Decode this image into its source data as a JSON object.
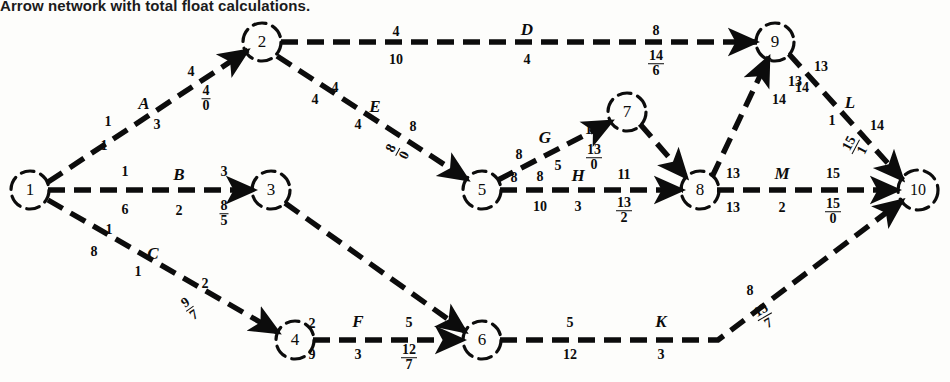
{
  "caption": "Arrow network with total float calculations.",
  "diagram": {
    "title": "Arrow network with total float calculations.",
    "type": "activity-on-arrow-network",
    "nodes": [
      {
        "id": "1",
        "label": "1",
        "x": 30,
        "y": 190
      },
      {
        "id": "2",
        "label": "2",
        "x": 262,
        "y": 42
      },
      {
        "id": "3",
        "label": "3",
        "x": 271,
        "y": 190
      },
      {
        "id": "4",
        "label": "4",
        "x": 295,
        "y": 340
      },
      {
        "id": "5",
        "label": "5",
        "x": 482,
        "y": 190
      },
      {
        "id": "6",
        "label": "6",
        "x": 482,
        "y": 340
      },
      {
        "id": "7",
        "label": "7",
        "x": 627,
        "y": 112
      },
      {
        "id": "8",
        "label": "8",
        "x": 700,
        "y": 190
      },
      {
        "id": "9",
        "label": "9",
        "x": 775,
        "y": 42
      },
      {
        "id": "10",
        "label": "10",
        "x": 918,
        "y": 190
      }
    ],
    "edges": [
      {
        "id": "A",
        "from": "1",
        "to": "2",
        "activity": "A",
        "dashed": true
      },
      {
        "id": "B",
        "from": "1",
        "to": "3",
        "activity": "B",
        "dashed": true
      },
      {
        "id": "C",
        "from": "1",
        "to": "4",
        "activity": "C",
        "dashed": true
      },
      {
        "id": "D",
        "from": "2",
        "to": "9",
        "activity": "D",
        "dashed": true
      },
      {
        "id": "E",
        "from": "2",
        "to": "5",
        "activity": "E",
        "dashed": true
      },
      {
        "id": "G",
        "from": "5",
        "to": "7",
        "activity": "G",
        "dashed": true
      },
      {
        "id": "H",
        "from": "5",
        "to": "8",
        "activity": "H",
        "dashed": true
      },
      {
        "id": "F",
        "from": "4",
        "to": "6",
        "activity": "F",
        "dashed": true
      },
      {
        "id": "K",
        "from": "6",
        "to": "10",
        "activity": "K",
        "dashed": true
      },
      {
        "id": "L",
        "from": "9",
        "to": "10",
        "activity": "L",
        "dashed": true
      },
      {
        "id": "M",
        "from": "8",
        "to": "10",
        "activity": "M",
        "dashed": true
      },
      {
        "id": "d1",
        "from": "3",
        "to": "6",
        "activity": "",
        "dashed": true
      },
      {
        "id": "d2",
        "from": "7",
        "to": "8",
        "activity": "",
        "dashed": true
      },
      {
        "id": "d3",
        "from": "8",
        "to": "9",
        "activity": "",
        "dashed": true
      }
    ],
    "labels": [
      {
        "id": "A-es",
        "edge": "A",
        "kind": "number",
        "text": "1",
        "x": 108,
        "y": 122
      },
      {
        "id": "A-ls",
        "edge": "A",
        "kind": "number",
        "text": "1",
        "x": 104,
        "y": 146
      },
      {
        "id": "A-name",
        "edge": "A",
        "kind": "activity",
        "text": "A",
        "x": 144,
        "y": 103
      },
      {
        "id": "A-dur",
        "edge": "A",
        "kind": "number",
        "text": "3",
        "x": 157,
        "y": 125
      },
      {
        "id": "A-ef",
        "edge": "A",
        "kind": "number",
        "text": "4",
        "x": 191,
        "y": 72
      },
      {
        "id": "A-frac",
        "edge": "A",
        "kind": "fraction",
        "top": "4",
        "bottom": "0",
        "x": 206,
        "y": 99
      },
      {
        "id": "B-es",
        "edge": "B",
        "kind": "number",
        "text": "1",
        "x": 125,
        "y": 172
      },
      {
        "id": "B-ls",
        "edge": "B",
        "kind": "number",
        "text": "6",
        "x": 125,
        "y": 210
      },
      {
        "id": "B-name",
        "edge": "B",
        "kind": "activity",
        "text": "B",
        "x": 179,
        "y": 174
      },
      {
        "id": "B-dur",
        "edge": "B",
        "kind": "number",
        "text": "2",
        "x": 179,
        "y": 211
      },
      {
        "id": "B-ef",
        "edge": "B",
        "kind": "number",
        "text": "3",
        "x": 224,
        "y": 172
      },
      {
        "id": "B-frac",
        "edge": "B",
        "kind": "fraction",
        "top": "8",
        "bottom": "5",
        "x": 224,
        "y": 214
      },
      {
        "id": "C-es",
        "edge": "C",
        "kind": "number",
        "text": "1",
        "x": 109,
        "y": 230
      },
      {
        "id": "C-ls",
        "edge": "C",
        "kind": "number",
        "text": "8",
        "x": 94,
        "y": 252
      },
      {
        "id": "C-name",
        "edge": "C",
        "kind": "activity",
        "text": "C",
        "x": 153,
        "y": 253
      },
      {
        "id": "C-dur",
        "edge": "C",
        "kind": "number",
        "text": "1",
        "x": 138,
        "y": 272
      },
      {
        "id": "C-ef",
        "edge": "C",
        "kind": "number",
        "text": "2",
        "x": 205,
        "y": 284
      },
      {
        "id": "C-frac",
        "edge": "C",
        "kind": "fraction",
        "top": "9",
        "bottom": "7",
        "x": 190,
        "y": 309,
        "rotate": -35
      },
      {
        "id": "D-es",
        "edge": "D",
        "kind": "number",
        "text": "4",
        "x": 396,
        "y": 32
      },
      {
        "id": "D-ls",
        "edge": "D",
        "kind": "number",
        "text": "10",
        "x": 396,
        "y": 60
      },
      {
        "id": "D-name",
        "edge": "D",
        "kind": "activity",
        "text": "D",
        "x": 527,
        "y": 29
      },
      {
        "id": "D-dur",
        "edge": "D",
        "kind": "number",
        "text": "4",
        "x": 527,
        "y": 60
      },
      {
        "id": "D-ef",
        "edge": "D",
        "kind": "number",
        "text": "8",
        "x": 656,
        "y": 31
      },
      {
        "id": "D-frac",
        "edge": "D",
        "kind": "fraction",
        "top": "14",
        "bottom": "6",
        "x": 656,
        "y": 64
      },
      {
        "id": "E-es",
        "edge": "E",
        "kind": "number",
        "text": "4",
        "x": 335,
        "y": 88
      },
      {
        "id": "E-ls",
        "edge": "E",
        "kind": "number",
        "text": "4",
        "x": 315,
        "y": 100
      },
      {
        "id": "E-name",
        "edge": "E",
        "kind": "activity",
        "text": "E",
        "x": 375,
        "y": 106
      },
      {
        "id": "E-dur",
        "edge": "E",
        "kind": "number",
        "text": "4",
        "x": 358,
        "y": 125
      },
      {
        "id": "E-ef",
        "edge": "E",
        "kind": "number",
        "text": "8",
        "x": 413,
        "y": 127
      },
      {
        "id": "E-frac",
        "edge": "E",
        "kind": "fraction",
        "top": "8",
        "bottom": "0",
        "x": 398,
        "y": 152,
        "rotate": -62
      },
      {
        "id": "G-es",
        "edge": "G",
        "kind": "number",
        "text": "8",
        "x": 519,
        "y": 155
      },
      {
        "id": "G-ls",
        "edge": "G",
        "kind": "number",
        "text": "8",
        "x": 514,
        "y": 178
      },
      {
        "id": "G-name",
        "edge": "G",
        "kind": "activity",
        "text": "G",
        "x": 545,
        "y": 137
      },
      {
        "id": "G-dur",
        "edge": "G",
        "kind": "number",
        "text": "5",
        "x": 558,
        "y": 166
      },
      {
        "id": "G-ef",
        "edge": "G",
        "kind": "number",
        "text": "13",
        "x": 592,
        "y": 130
      },
      {
        "id": "G-frac",
        "edge": "G",
        "kind": "fraction",
        "top": "13",
        "bottom": "0",
        "x": 594,
        "y": 158
      },
      {
        "id": "H-es",
        "edge": "H",
        "kind": "number",
        "text": "8",
        "x": 540,
        "y": 177
      },
      {
        "id": "H-ls",
        "edge": "H",
        "kind": "number",
        "text": "10",
        "x": 540,
        "y": 207
      },
      {
        "id": "H-name",
        "edge": "H",
        "kind": "activity",
        "text": "H",
        "x": 578,
        "y": 175
      },
      {
        "id": "H-dur",
        "edge": "H",
        "kind": "number",
        "text": "3",
        "x": 578,
        "y": 207
      },
      {
        "id": "H-ef",
        "edge": "H",
        "kind": "number",
        "text": "11",
        "x": 624,
        "y": 175
      },
      {
        "id": "H-frac",
        "edge": "H",
        "kind": "fraction",
        "top": "13",
        "bottom": "2",
        "x": 624,
        "y": 211
      },
      {
        "id": "F-es",
        "edge": "F",
        "kind": "number",
        "text": "2",
        "x": 312,
        "y": 324
      },
      {
        "id": "F-ls",
        "edge": "F",
        "kind": "number",
        "text": "9",
        "x": 312,
        "y": 355
      },
      {
        "id": "F-name",
        "edge": "F",
        "kind": "activity",
        "text": "F",
        "x": 358,
        "y": 321
      },
      {
        "id": "F-dur",
        "edge": "F",
        "kind": "number",
        "text": "3",
        "x": 358,
        "y": 355
      },
      {
        "id": "F-ef",
        "edge": "F",
        "kind": "number",
        "text": "5",
        "x": 409,
        "y": 323
      },
      {
        "id": "F-frac",
        "edge": "F",
        "kind": "fraction",
        "top": "12",
        "bottom": "7",
        "x": 409,
        "y": 358
      },
      {
        "id": "K-es",
        "edge": "K",
        "kind": "number",
        "text": "5",
        "x": 570,
        "y": 323
      },
      {
        "id": "K-ls",
        "edge": "K",
        "kind": "number",
        "text": "12",
        "x": 570,
        "y": 355
      },
      {
        "id": "K-name",
        "edge": "K",
        "kind": "activity",
        "text": "K",
        "x": 661,
        "y": 321
      },
      {
        "id": "K-dur",
        "edge": "K",
        "kind": "number",
        "text": "3",
        "x": 661,
        "y": 355
      },
      {
        "id": "K-ef",
        "edge": "K",
        "kind": "number",
        "text": "8",
        "x": 750,
        "y": 291
      },
      {
        "id": "K-frac",
        "edge": "K",
        "kind": "fraction",
        "top": "15",
        "bottom": "7",
        "x": 765,
        "y": 317,
        "rotate": -30
      },
      {
        "id": "L-es",
        "edge": "L",
        "kind": "number",
        "text": "13",
        "x": 821,
        "y": 67
      },
      {
        "id": "L-ls",
        "edge": "L",
        "kind": "number",
        "text": "14",
        "x": 802,
        "y": 88
      },
      {
        "id": "L-name",
        "edge": "L",
        "kind": "activity",
        "text": "L",
        "x": 850,
        "y": 102
      },
      {
        "id": "L-dur",
        "edge": "L",
        "kind": "number",
        "text": "1",
        "x": 832,
        "y": 121
      },
      {
        "id": "L-ef",
        "edge": "L",
        "kind": "number",
        "text": "14",
        "x": 877,
        "y": 126
      },
      {
        "id": "L-frac",
        "edge": "L",
        "kind": "fraction",
        "top": "15",
        "bottom": "1",
        "x": 856,
        "y": 147,
        "rotate": -62
      },
      {
        "id": "M-es",
        "edge": "M",
        "kind": "number",
        "text": "13",
        "x": 733,
        "y": 174
      },
      {
        "id": "M-ls",
        "edge": "M",
        "kind": "number",
        "text": "13",
        "x": 733,
        "y": 208
      },
      {
        "id": "M-name",
        "edge": "M",
        "kind": "activity",
        "text": "M",
        "x": 782,
        "y": 173
      },
      {
        "id": "M-dur",
        "edge": "M",
        "kind": "number",
        "text": "2",
        "x": 782,
        "y": 208
      },
      {
        "id": "M-ef",
        "edge": "M",
        "kind": "number",
        "text": "15",
        "x": 833,
        "y": 174
      },
      {
        "id": "M-frac",
        "edge": "M",
        "kind": "fraction",
        "top": "15",
        "bottom": "0",
        "x": 833,
        "y": 212
      },
      {
        "id": "d3-es",
        "edge": "d3",
        "kind": "number",
        "text": "13",
        "x": 795,
        "y": 82
      },
      {
        "id": "d3-ls",
        "edge": "d3",
        "kind": "number",
        "text": "14",
        "x": 779,
        "y": 100
      }
    ]
  }
}
